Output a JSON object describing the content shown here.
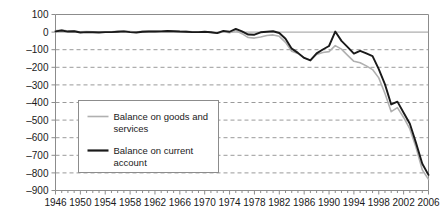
{
  "chart_data": {
    "type": "line",
    "title": "",
    "subtitle": "",
    "xlabel": "",
    "ylabel": "",
    "xlim": [
      1946,
      2006
    ],
    "ylim": [
      -900,
      100
    ],
    "ytick_step": 100,
    "xtick_step": 4,
    "grid": true,
    "grid_style": "dashed-horizontal",
    "legend_position": "inside-left-lower",
    "yticks": [
      100,
      0,
      -100,
      -200,
      -300,
      -400,
      -500,
      -600,
      -700,
      -800,
      -900
    ],
    "ytick_labels": [
      "100",
      "0",
      "–100",
      "–200",
      "–300",
      "–400",
      "–500",
      "–600",
      "–700",
      "–800",
      "–900"
    ],
    "xticks": [
      1946,
      1950,
      1954,
      1958,
      1962,
      1966,
      1970,
      1974,
      1978,
      1982,
      1986,
      1990,
      1994,
      1998,
      2002,
      2006
    ],
    "xtick_labels": [
      "1946",
      "1950",
      "1954",
      "1958",
      "1962",
      "1966",
      "1970",
      "1974",
      "1978",
      "1982",
      "1986",
      "1990",
      "1994",
      "1998",
      "2002",
      "2006"
    ],
    "minor_xticks_every": 1,
    "x": [
      1946,
      1947,
      1948,
      1949,
      1950,
      1951,
      1952,
      1953,
      1954,
      1955,
      1956,
      1957,
      1958,
      1959,
      1960,
      1961,
      1962,
      1963,
      1964,
      1965,
      1966,
      1967,
      1968,
      1969,
      1970,
      1971,
      1972,
      1973,
      1974,
      1975,
      1976,
      1977,
      1978,
      1979,
      1980,
      1981,
      1982,
      1983,
      1984,
      1985,
      1986,
      1987,
      1988,
      1989,
      1990,
      1991,
      1992,
      1993,
      1994,
      1995,
      1996,
      1997,
      1998,
      1999,
      2000,
      2001,
      2002,
      2003,
      2004,
      2005,
      2006
    ],
    "series": [
      {
        "name": "Balance on goods and services",
        "color": "#b0b0b0",
        "width": 1.6,
        "values": [
          7,
          11,
          6,
          6,
          1,
          3,
          2,
          1,
          2,
          2,
          4,
          6,
          3,
          0,
          4,
          5,
          4,
          5,
          7,
          5,
          3,
          4,
          1,
          1,
          2,
          -2,
          -6,
          2,
          -4,
          9,
          -9,
          -31,
          -34,
          -28,
          -19,
          -16,
          -24,
          -58,
          -109,
          -122,
          -145,
          -160,
          -127,
          -116,
          -111,
          -77,
          -97,
          -132,
          -166,
          -174,
          -192,
          -213,
          -260,
          -349,
          -452,
          -429,
          -485,
          -550,
          -656,
          -783,
          -837
        ],
        "linestyle": "solid"
      },
      {
        "name": "Balance on current account",
        "color": "#1a1a1a",
        "width": 1.9,
        "values": [
          4,
          9,
          3,
          5,
          -2,
          0,
          -1,
          -2,
          0,
          0,
          2,
          4,
          0,
          -2,
          2,
          3,
          3,
          4,
          6,
          5,
          3,
          2,
          0,
          0,
          2,
          -1,
          -6,
          7,
          2,
          18,
          4,
          -14,
          -15,
          -1,
          2,
          5,
          -5,
          -38,
          -94,
          -118,
          -147,
          -161,
          -121,
          -99,
          -79,
          3,
          -50,
          -85,
          -122,
          -106,
          -121,
          -136,
          -210,
          -297,
          -411,
          -395,
          -458,
          -521,
          -631,
          -748,
          -811
        ],
        "linestyle": "solid"
      }
    ]
  },
  "legend": {
    "items": [
      {
        "label_line1": "Balance on goods and",
        "label_line2": "services",
        "color": "#b0b0b0"
      },
      {
        "label_line1": "Balance on current",
        "label_line2": "account",
        "color": "#1a1a1a"
      }
    ]
  },
  "colors": {
    "axis": "#8c8c8c",
    "grid": "#9a9a9a",
    "text": "#1a1a1a",
    "goods_services": "#b0b0b0",
    "current_account": "#1a1a1a",
    "legend_border": "#8c8c8c",
    "background": "#ffffff"
  }
}
